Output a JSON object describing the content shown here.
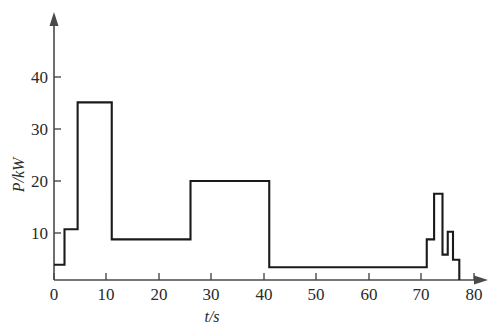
{
  "chart_data": {
    "type": "line",
    "title": "",
    "subtitle": "",
    "xlabel": "t/s",
    "ylabel": "P/kW",
    "xlim": [
      0,
      84
    ],
    "ylim": [
      0,
      47
    ],
    "xticks": [
      0,
      10,
      20,
      30,
      40,
      50,
      60,
      70,
      80
    ],
    "xtick_labels": [
      "0",
      "10",
      "20",
      "30",
      "40",
      "50",
      "60",
      "70",
      "80"
    ],
    "yticks": [
      10,
      20,
      30,
      40
    ],
    "ytick_labels": [
      "10",
      "20",
      "30",
      "40"
    ],
    "grid": false,
    "legend": null,
    "legend_position": "none",
    "line_color": "#1a1a1a",
    "axis_color": "#4a4a4a",
    "interpolation": "step",
    "series": [
      {
        "name": "P",
        "steps": [
          {
            "t_start": 0,
            "t_end": 2,
            "P": 3.0
          },
          {
            "t_start": 2,
            "t_end": 4.5,
            "P": 10.0
          },
          {
            "t_start": 4.5,
            "t_end": 11,
            "P": 35.0
          },
          {
            "t_start": 11,
            "t_end": 26,
            "P": 8.0
          },
          {
            "t_start": 26,
            "t_end": 41,
            "P": 19.5
          },
          {
            "t_start": 41,
            "t_end": 71,
            "P": 2.5
          },
          {
            "t_start": 71,
            "t_end": 72.4,
            "P": 8.0
          },
          {
            "t_start": 72.4,
            "t_end": 74.0,
            "P": 17.0
          },
          {
            "t_start": 74.0,
            "t_end": 75.0,
            "P": 5.0
          },
          {
            "t_start": 75.0,
            "t_end": 76.0,
            "P": 9.5
          },
          {
            "t_start": 76.0,
            "t_end": 77.2,
            "P": 4.0
          },
          {
            "t_start": 77.2,
            "t_end": 77.2,
            "P": 0.0
          }
        ],
        "x": [
          0,
          2,
          2,
          4.5,
          4.5,
          11,
          11,
          26,
          26,
          41,
          41,
          71,
          71,
          72.4,
          72.4,
          74.0,
          74.0,
          75.0,
          75.0,
          76.0,
          76.0,
          77.2,
          77.2
        ],
        "y": [
          3.0,
          3.0,
          10.0,
          10.0,
          35.0,
          35.0,
          8.0,
          8.0,
          19.5,
          19.5,
          2.5,
          2.5,
          8.0,
          8.0,
          17.0,
          17.0,
          5.0,
          5.0,
          9.5,
          9.5,
          4.0,
          4.0,
          0.0
        ]
      }
    ]
  }
}
